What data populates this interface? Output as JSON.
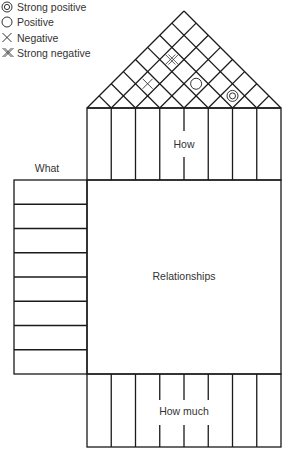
{
  "legend": {
    "items": [
      {
        "symbol": "strong-positive-icon",
        "label": "Strong positive"
      },
      {
        "symbol": "positive-icon",
        "label": "Positive"
      },
      {
        "symbol": "negative-icon",
        "label": "Negative"
      },
      {
        "symbol": "strong-negative-icon",
        "label": "Strong negative"
      }
    ]
  },
  "house": {
    "columns": 8,
    "what_rows": 8,
    "labels": {
      "how": "How",
      "what": "What",
      "relationships": "Relationships",
      "how_much": "How much"
    },
    "roof_correlations": [
      {
        "col_a": 1,
        "col_b": 5,
        "type": "strong-negative"
      },
      {
        "col_a": 1,
        "col_b": 3,
        "type": "negative"
      },
      {
        "col_a": 3,
        "col_b": 5,
        "type": "positive"
      },
      {
        "col_a": 5,
        "col_b": 6,
        "type": "strong-positive"
      }
    ]
  },
  "colors": {
    "line": "#1a1a1a",
    "text": "#333333",
    "background": "#ffffff"
  }
}
